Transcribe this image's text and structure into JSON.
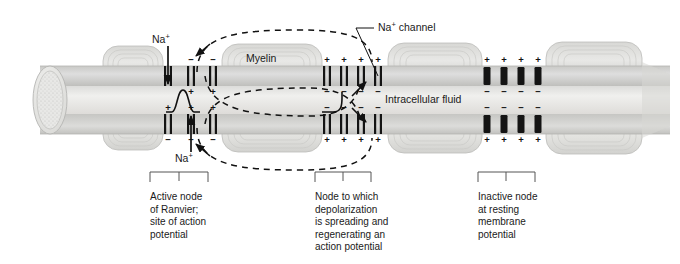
{
  "figure": {
    "background": "#ffffff",
    "ink": "#1a1a1a"
  },
  "labels": {
    "na_top": "Na",
    "na_top_sup": "+",
    "na_bottom": "Na",
    "na_bottom_sup": "+",
    "myelin": "Myelin",
    "na_channel": "Na",
    "na_channel_sup": "+",
    "na_channel_rest": " channel",
    "intracellular_fluid": "Intracellular fluid"
  },
  "captions": [
    {
      "name": "active-node",
      "lines": [
        "Active node",
        "of Ranvier;",
        "site of action",
        "potential"
      ],
      "x": 150,
      "bracket": {
        "x1": 150,
        "x2": 208,
        "tick": 179
      }
    },
    {
      "name": "spreading-node",
      "lines": [
        "Node to which",
        "depolarization",
        "is spreading and",
        "regenerating an",
        "action potential"
      ],
      "x": 315,
      "bracket": {
        "x1": 315,
        "x2": 371,
        "tick": 343
      }
    },
    {
      "name": "inactive-node",
      "lines": [
        "Inactive node",
        "at resting",
        "membrane",
        "potential"
      ],
      "x": 478,
      "bracket": {
        "x1": 478,
        "x2": 535,
        "tick": 506
      }
    }
  ],
  "nodes": [
    {
      "name": "active-node-of-ranvier",
      "state": "open",
      "x_center": 180,
      "channels_top": [
        {
          "x": 168,
          "above": "",
          "below": ""
        },
        {
          "x": 191,
          "above": "−",
          "below": "+"
        },
        {
          "x": 213,
          "above": "−",
          "below": "+"
        }
      ],
      "channels_bottom": [
        {
          "x": 168,
          "above": "+",
          "below": "−"
        },
        {
          "x": 191,
          "above": "+",
          "below": "−"
        },
        {
          "x": 213,
          "above": "+",
          "below": "−"
        }
      ]
    },
    {
      "name": "depolarizing-node",
      "state": "open",
      "x_center": 343,
      "channels_top": [
        {
          "x": 327,
          "above": "+",
          "below": "−"
        },
        {
          "x": 344,
          "above": "+",
          "below": "−"
        },
        {
          "x": 361,
          "above": "+",
          "below": "−"
        },
        {
          "x": 378,
          "above": "+",
          "below": "−"
        }
      ],
      "channels_bottom": [
        {
          "x": 327,
          "above": "−",
          "below": "+"
        },
        {
          "x": 344,
          "above": "−",
          "below": "+"
        },
        {
          "x": 361,
          "above": "−",
          "below": "+"
        },
        {
          "x": 378,
          "above": "−",
          "below": "+"
        }
      ]
    },
    {
      "name": "inactive-node",
      "state": "closed",
      "x_center": 506,
      "channels_top": [
        {
          "x": 487,
          "above": "+",
          "below": "−"
        },
        {
          "x": 504,
          "above": "+",
          "below": "−"
        },
        {
          "x": 521,
          "above": "+",
          "below": "−"
        },
        {
          "x": 538,
          "above": "+",
          "below": "−"
        }
      ],
      "channels_bottom": [
        {
          "x": 487,
          "above": "−",
          "below": "+"
        },
        {
          "x": 504,
          "above": "−",
          "below": "+"
        },
        {
          "x": 521,
          "above": "−",
          "below": "+"
        },
        {
          "x": 538,
          "above": "−",
          "below": "+"
        }
      ]
    }
  ],
  "myelin_segments": [
    {
      "name": "myelin-segment-1",
      "x": 103,
      "w": 60
    },
    {
      "name": "myelin-segment-2",
      "x": 222,
      "w": 100
    },
    {
      "name": "myelin-segment-3",
      "x": 388,
      "w": 94
    },
    {
      "name": "myelin-segment-4",
      "x": 546,
      "w": 96
    }
  ],
  "colors": {
    "axon_fill": "#e4e4e2",
    "axon_core": "#ececea",
    "membrane": "#b9b9b6",
    "myelin_fill": "#d3d3d0",
    "myelin_line": "#bdbdba",
    "channel_bar": "#141414",
    "dash_line": "#111111",
    "bracket": "#555555"
  },
  "arrows": {
    "na_influx_top": "downward into axon at active node",
    "na_influx_bottom": "upward into axon at active node",
    "current_loops": 4
  },
  "action_potential_spike": {
    "name": "action-potential-spike",
    "x": 183,
    "description": "bell-shaped action potential waveform inside axon"
  }
}
